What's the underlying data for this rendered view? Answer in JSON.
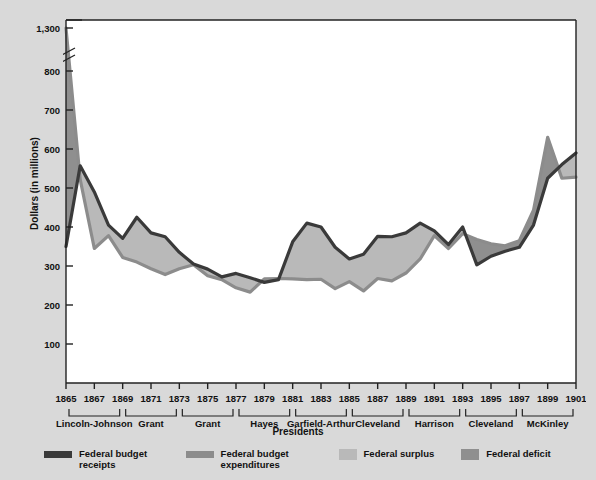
{
  "chart_data": {
    "type": "line",
    "title": "",
    "xlabel": "Presidents",
    "ylabel": "Dollars (in millions)",
    "ylim": [
      0,
      1300
    ],
    "y_ticks": [
      100,
      200,
      300,
      400,
      500,
      600,
      700,
      800,
      1300
    ],
    "y_tick_labels": [
      "100",
      "200",
      "300",
      "400",
      "500",
      "600",
      "700",
      "800",
      "1,300"
    ],
    "y_axis_break": {
      "between": [
        800,
        1300
      ],
      "note": "axis break between 800 and 1,300"
    },
    "grid": false,
    "legend_position": "bottom",
    "x": [
      1865,
      1866,
      1867,
      1868,
      1869,
      1870,
      1871,
      1872,
      1873,
      1874,
      1875,
      1876,
      1877,
      1878,
      1879,
      1880,
      1881,
      1882,
      1883,
      1884,
      1885,
      1886,
      1887,
      1888,
      1889,
      1890,
      1891,
      1892,
      1893,
      1894,
      1895,
      1896,
      1897,
      1898,
      1899,
      1900,
      1901
    ],
    "x_tick_labels": [
      "1865",
      "1867",
      "1869",
      "1871",
      "1873",
      "1875",
      "1877",
      "1879",
      "1881",
      "1883",
      "1885",
      "1887",
      "1889",
      "1891",
      "1893",
      "1895",
      "1897",
      "1899",
      "1901"
    ],
    "series": [
      {
        "name": "Federal budget receipts",
        "color": "#3a3a3a",
        "values": [
          350,
          557,
          490,
          405,
          371,
          425,
          385,
          375,
          335,
          305,
          292,
          272,
          281,
          270,
          258,
          265,
          362,
          410,
          400,
          348,
          318,
          330,
          376,
          375,
          385,
          410,
          390,
          355,
          400,
          303,
          325,
          338,
          348,
          405,
          525,
          560,
          590
        ]
      },
      {
        "name": "Federal budget expenditures",
        "color": "#8c8c8c",
        "values": [
          1298,
          522,
          345,
          378,
          322,
          310,
          293,
          278,
          293,
          303,
          275,
          265,
          244,
          233,
          267,
          268,
          267,
          265,
          266,
          242,
          260,
          236,
          268,
          262,
          282,
          318,
          378,
          345,
          383,
          368,
          357,
          352,
          365,
          443,
          630,
          525,
          528
        ]
      }
    ],
    "fills": [
      {
        "name": "Federal surplus",
        "color": "#b3b3b3",
        "description": "receipts above expenditures"
      },
      {
        "name": "Federal deficit",
        "color": "#8f8f8f",
        "description": "expenditures above receipts"
      }
    ],
    "presidents": [
      {
        "label": "Lincoln-Johnson",
        "start": 1865,
        "end": 1869
      },
      {
        "label": "Grant",
        "start": 1869,
        "end": 1873
      },
      {
        "label": "Grant",
        "start": 1873,
        "end": 1877
      },
      {
        "label": "Hayes",
        "start": 1877,
        "end": 1881
      },
      {
        "label": "Garfield-Arthur",
        "start": 1881,
        "end": 1885
      },
      {
        "label": "Cleveland",
        "start": 1885,
        "end": 1889
      },
      {
        "label": "Harrison",
        "start": 1889,
        "end": 1893
      },
      {
        "label": "Cleveland",
        "start": 1893,
        "end": 1897
      },
      {
        "label": "McKinley",
        "start": 1897,
        "end": 1901
      }
    ]
  },
  "legend": {
    "items": [
      {
        "label": "Federal budget\nreceipts",
        "color": "#3a3a3a",
        "shape": "line"
      },
      {
        "label": "Federal budget\nexpenditures",
        "color": "#8c8c8c",
        "shape": "line"
      },
      {
        "label": "Federal surplus",
        "color": "#b9b9b9",
        "shape": "box"
      },
      {
        "label": "Federal deficit",
        "color": "#8f8f8f",
        "shape": "box"
      }
    ]
  },
  "axis_titles": {
    "y": "Dollars (in millions)",
    "x": "Presidents"
  },
  "colors": {
    "background": "#d9d9d9",
    "plot_background": "#ffffff",
    "receipts_line": "#3a3a3a",
    "expenditures_line": "#8c8c8c",
    "surplus_fill": "#b9b9b9",
    "deficit_fill": "#8f8f8f",
    "axis": "#222222",
    "text": "#111111"
  }
}
